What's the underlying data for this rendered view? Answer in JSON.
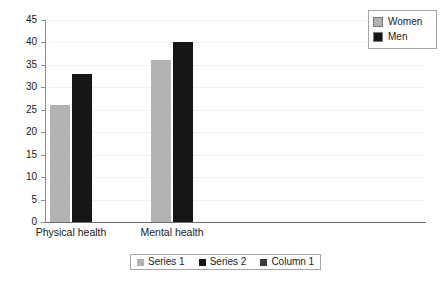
{
  "chart_data": {
    "type": "bar",
    "title": "",
    "subtitle": "",
    "xlabel": "",
    "ylabel": "",
    "categories": [
      "Physical health",
      "Mental health"
    ],
    "series": [
      {
        "name": "Women",
        "values": [
          26,
          36
        ],
        "color": "#b3b3b3"
      },
      {
        "name": "Men",
        "values": [
          33,
          40
        ],
        "color": "#161616"
      }
    ],
    "grouped_values": {
      "Physical health": {
        "Women": 26,
        "Men": 36
      },
      "Mental health": {
        "Women": 33,
        "Men": 40
      }
    },
    "ylim": [
      0,
      45
    ],
    "ytick_labels": [
      "0",
      "5",
      "10",
      "15",
      "20",
      "25",
      "30",
      "35",
      "40",
      "45"
    ],
    "ytick_values": [
      0,
      5,
      10,
      15,
      20,
      25,
      30,
      35,
      40,
      45
    ],
    "grid": true,
    "grid_axis": "y",
    "legend_position": "top-right",
    "annotations": []
  },
  "legend": {
    "entries": [
      {
        "label": "Women",
        "color": "#b3b3b3"
      },
      {
        "label": "Men",
        "color": "#161616"
      }
    ]
  },
  "series_legend": {
    "entries": [
      {
        "label": "Series 1",
        "color": "#b3b3b3"
      },
      {
        "label": "Series 2",
        "color": "#161616"
      },
      {
        "label": "Column 1",
        "color": "#3b3b3b"
      }
    ]
  },
  "axis": {
    "y_min_label": "0",
    "y_max_label": "45"
  }
}
